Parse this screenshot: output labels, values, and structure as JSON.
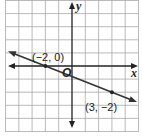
{
  "diagram": {
    "type": "coordinate-plane-line",
    "grid": {
      "xmin": -5,
      "xmax": 5,
      "ymin": -5,
      "ymax": 5,
      "step": 1
    },
    "axes": {
      "x_label": "x",
      "y_label": "y",
      "origin_label": "O"
    },
    "points": [
      {
        "x": -2,
        "y": 0,
        "label": "(−2, 0)"
      },
      {
        "x": 3,
        "y": -2,
        "label": "(3, −2)"
      }
    ],
    "line": {
      "through": [
        [
          -2,
          0
        ],
        [
          3,
          -2
        ]
      ],
      "slope": -0.4,
      "arrows": "both"
    },
    "colors": {
      "grid": "#9a9a9a",
      "axis": "#222222",
      "line": "#333333"
    }
  }
}
